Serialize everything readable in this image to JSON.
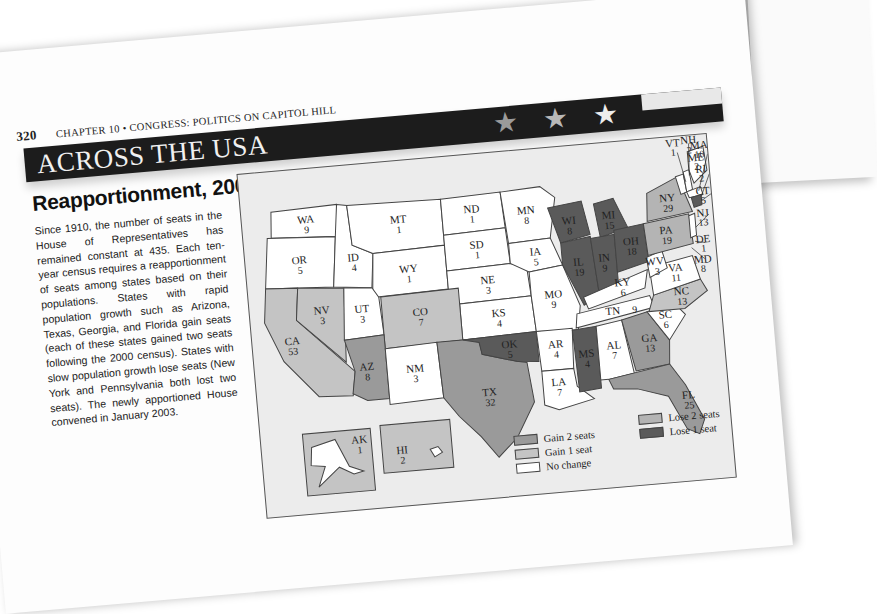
{
  "running_head": {
    "page_number": "320",
    "chapter": "CHAPTER 10 • CONGRESS: POLITICS ON CAPITOL HILL"
  },
  "banner": {
    "title": "ACROSS THE USA",
    "decoration": [
      "star-icon",
      "star-icon",
      "star-icon",
      "flag-stripe"
    ]
  },
  "section": {
    "title": "Reapportionment, 2000",
    "body": "Since 1910, the number of seats in the House of Representatives has remained constant at 435. Each ten-year census requires a reapportionment of seats among states based on their populations. States with rapid population growth such as Arizona, Texas, Georgia, and Florida gain seats (each of these states gained two seats following the 2000 census). States with slow population growth lose seats (New York and Pennsylvania both lost two seats). The newly apportioned House convened in January 2003."
  },
  "colors": {
    "gain2": "#9a9a9a",
    "gain1": "#c4c4c4",
    "no_change": "#ffffff",
    "lose2": "#b4b4b4",
    "lose1": "#5a5a5a",
    "banner": "#1c1c1c",
    "map_bg": "#ececec"
  },
  "map": {
    "states": [
      {
        "abbr": "WA",
        "seats": "9",
        "change": "no_change"
      },
      {
        "abbr": "OR",
        "seats": "5",
        "change": "no_change"
      },
      {
        "abbr": "ID",
        "seats": "4",
        "change": "no_change"
      },
      {
        "abbr": "MT",
        "seats": "1",
        "change": "no_change"
      },
      {
        "abbr": "WY",
        "seats": "1",
        "change": "no_change"
      },
      {
        "abbr": "ND",
        "seats": "1",
        "change": "no_change"
      },
      {
        "abbr": "SD",
        "seats": "1",
        "change": "no_change"
      },
      {
        "abbr": "NE",
        "seats": "3",
        "change": "no_change"
      },
      {
        "abbr": "MN",
        "seats": "8",
        "change": "no_change"
      },
      {
        "abbr": "IA",
        "seats": "5",
        "change": "no_change"
      },
      {
        "abbr": "KS",
        "seats": "4",
        "change": "no_change"
      },
      {
        "abbr": "MO",
        "seats": "9",
        "change": "no_change"
      },
      {
        "abbr": "CA",
        "seats": "53",
        "change": "gain1"
      },
      {
        "abbr": "NV",
        "seats": "3",
        "change": "gain1"
      },
      {
        "abbr": "UT",
        "seats": "3",
        "change": "no_change"
      },
      {
        "abbr": "CO",
        "seats": "7",
        "change": "gain1"
      },
      {
        "abbr": "AZ",
        "seats": "8",
        "change": "gain2"
      },
      {
        "abbr": "NM",
        "seats": "3",
        "change": "no_change"
      },
      {
        "abbr": "TX",
        "seats": "32",
        "change": "gain2"
      },
      {
        "abbr": "OK",
        "seats": "5",
        "change": "lose1"
      },
      {
        "abbr": "AR",
        "seats": "4",
        "change": "no_change"
      },
      {
        "abbr": "LA",
        "seats": "7",
        "change": "no_change"
      },
      {
        "abbr": "WI",
        "seats": "8",
        "change": "lose1"
      },
      {
        "abbr": "MI",
        "seats": "15",
        "change": "lose1"
      },
      {
        "abbr": "IL",
        "seats": "19",
        "change": "lose1"
      },
      {
        "abbr": "IN",
        "seats": "9",
        "change": "lose1"
      },
      {
        "abbr": "OH",
        "seats": "18",
        "change": "lose1"
      },
      {
        "abbr": "KY",
        "seats": "6",
        "change": "no_change"
      },
      {
        "abbr": "TN",
        "seats": "9",
        "change": "no_change"
      },
      {
        "abbr": "MS",
        "seats": "4",
        "change": "lose1"
      },
      {
        "abbr": "AL",
        "seats": "7",
        "change": "no_change"
      },
      {
        "abbr": "GA",
        "seats": "13",
        "change": "gain2"
      },
      {
        "abbr": "FL",
        "seats": "25",
        "change": "gain2"
      },
      {
        "abbr": "SC",
        "seats": "6",
        "change": "no_change"
      },
      {
        "abbr": "NC",
        "seats": "13",
        "change": "gain1"
      },
      {
        "abbr": "VA",
        "seats": "11",
        "change": "no_change"
      },
      {
        "abbr": "WV",
        "seats": "3",
        "change": "no_change"
      },
      {
        "abbr": "PA",
        "seats": "19",
        "change": "lose2"
      },
      {
        "abbr": "NY",
        "seats": "29",
        "change": "lose2"
      },
      {
        "abbr": "VT",
        "seats": "1",
        "change": "no_change"
      },
      {
        "abbr": "NH",
        "seats": "2",
        "change": "no_change"
      },
      {
        "abbr": "ME",
        "seats": "2",
        "change": "no_change"
      },
      {
        "abbr": "MA",
        "seats": "10",
        "change": "no_change"
      },
      {
        "abbr": "RI",
        "seats": "2",
        "change": "no_change"
      },
      {
        "abbr": "CT",
        "seats": "5",
        "change": "lose1"
      },
      {
        "abbr": "NJ",
        "seats": "13",
        "change": "no_change"
      },
      {
        "abbr": "DE",
        "seats": "1",
        "change": "no_change"
      },
      {
        "abbr": "MD",
        "seats": "8",
        "change": "no_change"
      },
      {
        "abbr": "AK",
        "seats": "1",
        "change": "no_change"
      },
      {
        "abbr": "HI",
        "seats": "2",
        "change": "no_change"
      }
    ],
    "legend": [
      {
        "label": "Gain 2 seats",
        "key": "gain2"
      },
      {
        "label": "Gain 1 seat",
        "key": "gain1"
      },
      {
        "label": "No change",
        "key": "no_change"
      },
      {
        "label": "Lose 2 seats",
        "key": "lose2"
      },
      {
        "label": "Lose 1 seat",
        "key": "lose1"
      }
    ]
  }
}
